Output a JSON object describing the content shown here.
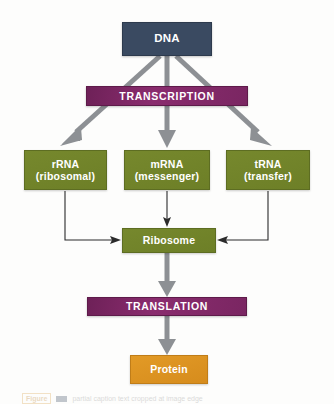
{
  "figure": {
    "background_color": "#fdfdfc"
  },
  "nodes": {
    "dna": {
      "label": "DNA",
      "color": "#3a4a61",
      "shape": "rectangle"
    },
    "transcription": {
      "label": "TRANSCRIPTION",
      "color": "#7d2764",
      "shape": "bar"
    },
    "rrna": {
      "line1": "rRNA",
      "line2": "(ribosomal)",
      "color": "#71832a",
      "shape": "rectangle"
    },
    "mrna": {
      "line1": "mRNA",
      "line2": "(messenger)",
      "color": "#71832a",
      "shape": "rectangle"
    },
    "trna": {
      "line1": "tRNA",
      "line2": "(transfer)",
      "color": "#71832a",
      "shape": "rectangle"
    },
    "ribosome": {
      "label": "Ribosome",
      "color": "#71832a",
      "shape": "rectangle"
    },
    "translation": {
      "label": "TRANSLATION",
      "color": "#7d2764",
      "shape": "bar"
    },
    "protein": {
      "label": "Protein",
      "color": "#dd9321",
      "shape": "rectangle"
    }
  },
  "edges": [
    {
      "from": "dna",
      "to": "rrna",
      "style": "thick-gray",
      "color": "#8d9094"
    },
    {
      "from": "dna",
      "to": "mrna",
      "style": "thick-gray",
      "color": "#8d9094"
    },
    {
      "from": "dna",
      "to": "trna",
      "style": "thick-gray",
      "color": "#8d9094"
    },
    {
      "from": "rrna",
      "to": "ribosome",
      "style": "thin-black",
      "color": "#2b2b2b"
    },
    {
      "from": "mrna",
      "to": "ribosome",
      "style": "thin-black",
      "color": "#2b2b2b"
    },
    {
      "from": "trna",
      "to": "ribosome",
      "style": "thin-black",
      "color": "#2b2b2b"
    },
    {
      "from": "ribosome",
      "to": "translation",
      "style": "thick-gray",
      "color": "#8d9094"
    },
    {
      "from": "translation",
      "to": "protein",
      "style": "thick-gray",
      "color": "#8d9094"
    }
  ],
  "caption": {
    "figure_tag": "Figure",
    "text": "partial caption text cropped at image edge"
  }
}
